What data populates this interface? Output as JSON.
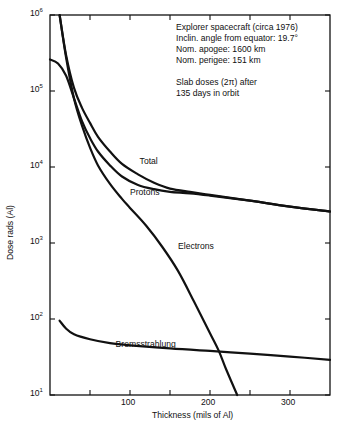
{
  "chart_data": {
    "type": "line",
    "title": "",
    "xlabel": "Thickness (mils of Al)",
    "ylabel": "Dose rads (Al)",
    "xscale": "linear",
    "yscale": "log",
    "xlim": [
      0,
      350
    ],
    "ylim": [
      10,
      1000000
    ],
    "x_ticks": [
      50,
      100,
      150,
      200,
      250,
      300
    ],
    "x_tick_labels": [
      "",
      "100",
      "",
      "200",
      "",
      "300"
    ],
    "y_ticks": [
      10,
      100,
      1000,
      10000,
      100000,
      1000000
    ],
    "y_tick_labels": [
      {
        "base": "10",
        "exp": "1"
      },
      {
        "base": "10",
        "exp": "2"
      },
      {
        "base": "10",
        "exp": "3"
      },
      {
        "base": "10",
        "exp": "4"
      },
      {
        "base": "10",
        "exp": "5"
      },
      {
        "base": "10",
        "exp": "6"
      }
    ],
    "grid": false,
    "legend": "inline curve labels",
    "annotation": [
      "Explorer spacecraft (circa 1976)",
      "Inclin. angle from equator: 19.7°",
      "Nom. apogee:   1600 km",
      "Nom. perigee:    151 km",
      "",
      "Slab doses (2π) after",
      "135 days in orbit"
    ],
    "series": [
      {
        "name": "Total",
        "x": [
          12,
          20,
          30,
          40,
          50,
          60,
          75,
          90,
          110,
          130,
          150,
          175,
          200,
          250,
          300,
          350
        ],
        "y": [
          1000000,
          300000,
          110000,
          60000,
          38000,
          25000,
          16000,
          11000,
          8000,
          6200,
          5200,
          4700,
          4300,
          3600,
          3000,
          2600
        ]
      },
      {
        "name": "Protons",
        "x": [
          0,
          10,
          20,
          30,
          40,
          50,
          60,
          75,
          90,
          110,
          130,
          150,
          175,
          200,
          250,
          300,
          350
        ],
        "y": [
          260000,
          230000,
          160000,
          80000,
          40000,
          24000,
          16000,
          10500,
          7500,
          5800,
          5100,
          4700,
          4500,
          4200,
          3600,
          3000,
          2600
        ]
      },
      {
        "name": "Electrons",
        "x": [
          12,
          20,
          30,
          40,
          50,
          60,
          75,
          90,
          100,
          120,
          140,
          160,
          180,
          200,
          211,
          220,
          234
        ],
        "y": [
          1000000,
          280000,
          80000,
          35000,
          18000,
          10500,
          6000,
          3800,
          2900,
          1700,
          900,
          430,
          170,
          65,
          38,
          22,
          10
        ]
      },
      {
        "name": "Bremsstrahlung",
        "x": [
          12,
          20,
          30,
          50,
          75,
          100,
          150,
          200,
          250,
          300,
          350
        ],
        "y": [
          95,
          75,
          63,
          54,
          48,
          45,
          41,
          38,
          35,
          32,
          29
        ]
      }
    ],
    "curve_labels": [
      {
        "text": "Total",
        "x": 112,
        "y": 11500
      },
      {
        "text": "Protons",
        "x": 100,
        "y": 4600
      },
      {
        "text": "Electrons",
        "x": 160,
        "y": 880
      },
      {
        "text": "Bremsstrahlung",
        "x": 82,
        "y": 46
      }
    ]
  }
}
